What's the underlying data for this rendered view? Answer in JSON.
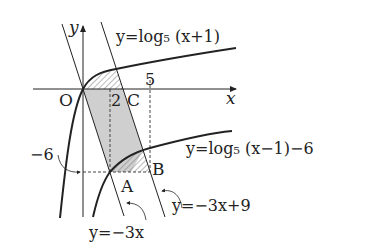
{
  "diagram": {
    "axes": {
      "x_label": "x",
      "y_label": "y",
      "origin_label": "O"
    },
    "tick_labels": {
      "x_two": "2",
      "x_five": "5",
      "y_neg_six": "−6"
    },
    "points": {
      "A": "A",
      "B": "B",
      "C": "C"
    },
    "curves": {
      "log_upper": "y=log₅ (x+1)",
      "log_lower": "y=log₅ (x−1)−6",
      "line_left": "y=−3x",
      "line_right": "y=−3x+9"
    },
    "colors": {
      "stroke": "#222222",
      "shade": "#c8c8c8",
      "hatch": "#666666"
    }
  }
}
